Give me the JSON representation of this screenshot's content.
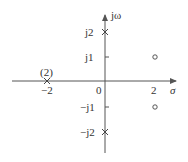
{
  "diagram": {
    "type": "pole-zero plot",
    "axes": {
      "horizontal_label": "σ",
      "vertical_label": "jω",
      "origin_label": "0"
    },
    "ticks": {
      "x": [
        {
          "value": -2,
          "label": "−2"
        },
        {
          "value": 2,
          "label": "2"
        }
      ],
      "y": [
        {
          "value": 2,
          "label": "j2"
        },
        {
          "value": 1,
          "label": "j1"
        },
        {
          "value": -1,
          "label": "−j1"
        },
        {
          "value": -2,
          "label": "−j2"
        }
      ]
    },
    "poles": [
      {
        "re": -2,
        "im": 0,
        "multiplicity": 2,
        "multiplicity_label": "(2)"
      },
      {
        "re": 0,
        "im": 2
      },
      {
        "re": 0,
        "im": -2
      }
    ],
    "zeros": [
      {
        "re": 2,
        "im": 1
      },
      {
        "re": 2,
        "im": -1
      }
    ],
    "colors": {
      "stroke": "#555555",
      "text": "#333333"
    }
  }
}
